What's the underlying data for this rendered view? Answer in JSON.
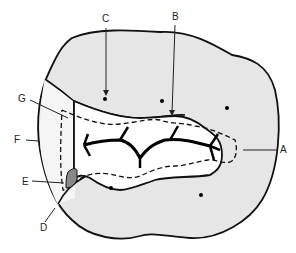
{
  "diagram": {
    "colors": {
      "enamel_fill": "#e6e6e6",
      "outline": "#111111",
      "background": "#ffffff",
      "marked_area": "#888888"
    },
    "labels": [
      {
        "id": "A",
        "text": "A"
      },
      {
        "id": "B",
        "text": "B"
      },
      {
        "id": "C",
        "text": "C"
      },
      {
        "id": "D",
        "text": "D"
      },
      {
        "id": "E",
        "text": "E"
      },
      {
        "id": "F",
        "text": "F"
      },
      {
        "id": "G",
        "text": "G"
      }
    ]
  }
}
